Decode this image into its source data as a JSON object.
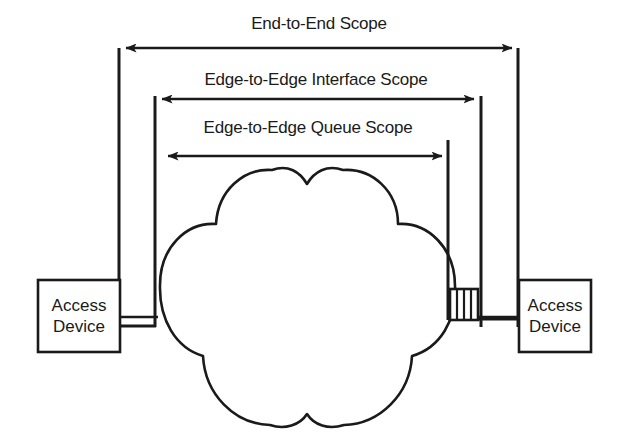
{
  "diagram": {
    "type": "network-scope-diagram",
    "background_color": "#ffffff",
    "stroke_color": "#1a1a1a",
    "scopes": [
      {
        "id": "end-to-end",
        "label": "End-to-End Scope",
        "label_x": 319,
        "label_y": 20,
        "arrow_y": 48,
        "arrow_x1": 126,
        "arrow_x2": 512,
        "left_rule_x": 119,
        "right_rule_x": 518,
        "rule_bottom_y": 327
      },
      {
        "id": "edge-to-edge-interface",
        "label": "Edge-to-Edge Interface Scope",
        "label_x": 316,
        "label_y": 72,
        "arrow_y": 99,
        "arrow_x1": 162,
        "arrow_x2": 474,
        "left_rule_x": 155,
        "right_rule_x": 481,
        "rule_top_y": 96,
        "rule_bottom_y": 327
      },
      {
        "id": "edge-to-edge-queue",
        "label": "Edge-to-Edge Queue Scope",
        "label_x": 308,
        "label_y": 118,
        "arrow_y": 156,
        "arrow_x1": 168,
        "arrow_x2": 442,
        "right_rule_x": 448,
        "rule_top_y": 140,
        "rule_bottom_y": 320
      }
    ],
    "devices": [
      {
        "id": "access-device-left",
        "line1": "Access",
        "line2": "Device",
        "x": 38,
        "y": 280,
        "width": 82,
        "height": 72,
        "connector_y": 317,
        "connector_x1": 120,
        "connector_x2": 156
      },
      {
        "id": "access-device-right",
        "line1": "Access",
        "line2": "Device",
        "x": 519,
        "y": 280,
        "width": 72,
        "height": 72,
        "connector_y": 317,
        "connector_x1": 478,
        "connector_x2": 519
      }
    ],
    "cloud": {
      "id": "network-cloud",
      "center_x": 307,
      "top_y": 168,
      "bottom_y": 428,
      "left_x": 160,
      "right_x": 466
    },
    "queue": {
      "id": "queue-buffer",
      "x": 450,
      "y": 289,
      "width": 28,
      "height": 31,
      "divider_count": 3
    }
  }
}
